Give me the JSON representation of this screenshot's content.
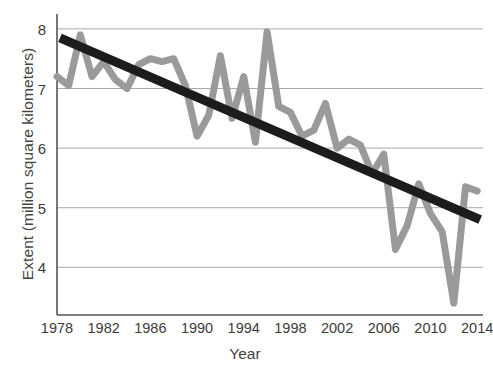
{
  "chart_data": {
    "type": "line",
    "title": "",
    "xlabel": "Year",
    "ylabel": "Extent (million square kilometers)",
    "xlim": [
      1978,
      2014.5
    ],
    "ylim": [
      3.2,
      8.25
    ],
    "xticks": [
      1978,
      1982,
      1986,
      1990,
      1994,
      1998,
      2002,
      2006,
      2010,
      2014
    ],
    "yticks": [
      4,
      5,
      6,
      7,
      8
    ],
    "grid": "horizontal",
    "legend": "none",
    "colors": {
      "data_line": "#9a9a9a",
      "trend_line": "#1c1c1c",
      "gridline": "#aaaaaa",
      "axis": "#555555",
      "text": "#3c3c3c",
      "background": "#ffffff"
    },
    "series": [
      {
        "name": "Sea ice extent",
        "style": "line",
        "color": "#9a9a9a",
        "x": [
          1978,
          1979,
          1980,
          1981,
          1982,
          1983,
          1984,
          1985,
          1986,
          1987,
          1988,
          1989,
          1990,
          1991,
          1992,
          1993,
          1994,
          1995,
          1996,
          1997,
          1998,
          1999,
          2000,
          2001,
          2002,
          2003,
          2004,
          2005,
          2006,
          2007,
          2008,
          2009,
          2010,
          2011,
          2012,
          2013,
          2014
        ],
        "values": [
          7.2,
          7.05,
          7.9,
          7.2,
          7.45,
          7.15,
          7.0,
          7.4,
          7.5,
          7.45,
          7.5,
          7.05,
          6.2,
          6.55,
          7.55,
          6.5,
          7.2,
          6.1,
          7.95,
          6.7,
          6.6,
          6.2,
          6.3,
          6.75,
          6.0,
          6.15,
          6.05,
          5.57,
          5.9,
          4.3,
          4.7,
          5.4,
          4.9,
          4.6,
          3.4,
          5.35,
          5.28
        ]
      },
      {
        "name": "Linear trend",
        "style": "trend",
        "color": "#1c1c1c",
        "x": [
          1978,
          2014
        ],
        "values": [
          7.85,
          4.8
        ]
      }
    ]
  }
}
